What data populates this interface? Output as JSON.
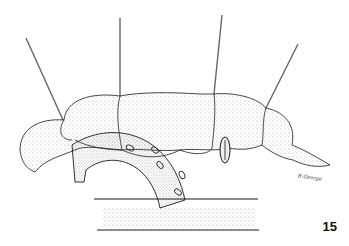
{
  "figure": {
    "number": "15",
    "signature": "R.George"
  },
  "colors": {
    "ink": "#1a1a1a",
    "stipple": "#555555",
    "suture": "#666666",
    "background": "#ffffff"
  }
}
